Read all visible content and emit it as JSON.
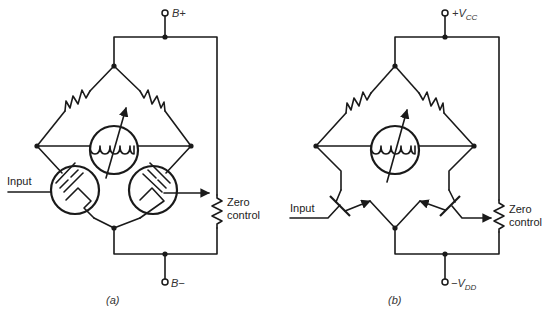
{
  "figure": {
    "panels": [
      {
        "id": "a",
        "caption": "(a)",
        "supply_positive": "B+",
        "supply_negative": "B−",
        "input_label": "Input",
        "pot_label_line1": "Zero",
        "pot_label_line2": "control",
        "active_devices": "vacuum triodes",
        "components": [
          "resistor",
          "resistor",
          "meter",
          "triode",
          "triode",
          "potentiometer"
        ]
      },
      {
        "id": "b",
        "caption": "(b)",
        "supply_positive_main": "+V",
        "supply_positive_sub": "CC",
        "supply_negative_main": "−V",
        "supply_negative_sub": "DD",
        "input_label": "Input",
        "pot_label_line1": "Zero",
        "pot_label_line2": "control",
        "active_devices": "bipolar transistors",
        "components": [
          "resistor",
          "resistor",
          "meter",
          "transistor",
          "transistor",
          "potentiometer"
        ]
      }
    ]
  }
}
